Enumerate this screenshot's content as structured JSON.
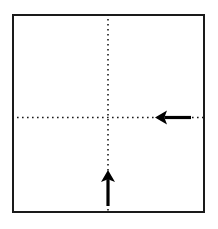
{
  "diagram": {
    "background_color": "#ffffff",
    "paper": {
      "name": "paper-square",
      "shape": "square",
      "fill_color": "#ffffff",
      "stroke_color": "#1a1a1a",
      "stroke_width": 2,
      "x": 12,
      "y": 14,
      "width": 193,
      "height": 199
    },
    "fold_lines": [
      {
        "name": "vertical-fold-line",
        "orientation": "vertical",
        "style": "dotted",
        "color": "#1a1a1a",
        "stroke_width": 1.6,
        "dot_period": 5,
        "x": 108,
        "y1": 14,
        "y2": 213
      },
      {
        "name": "horizontal-fold-line",
        "orientation": "horizontal",
        "style": "dotted",
        "color": "#1a1a1a",
        "stroke_width": 1.6,
        "dot_period": 5,
        "y": 117,
        "x1": 12,
        "x2": 205
      }
    ],
    "arrows": [
      {
        "name": "arrow-left",
        "direction": "left",
        "color": "#000000",
        "tip_x": 155,
        "tip_y": 117,
        "tail_x": 191,
        "tail_y": 117,
        "shaft_width": 3.2,
        "head_length": 12,
        "head_half_width": 7
      },
      {
        "name": "arrow-up",
        "direction": "up",
        "color": "#000000",
        "tip_x": 108,
        "tip_y": 170,
        "tail_x": 108,
        "tail_y": 206,
        "shaft_width": 3.2,
        "head_length": 12,
        "head_half_width": 7
      }
    ]
  }
}
